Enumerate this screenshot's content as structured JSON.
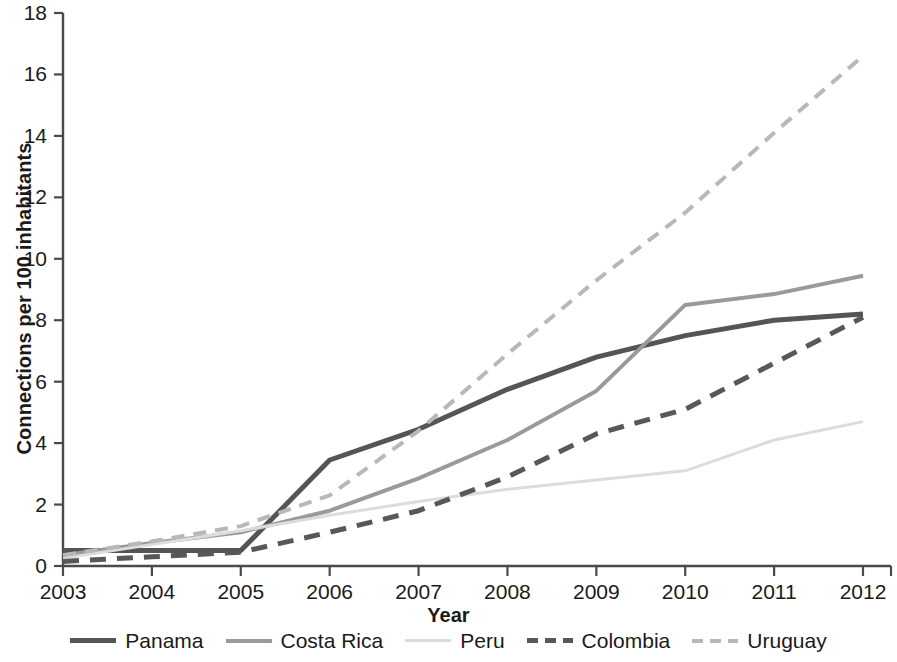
{
  "chart_data": {
    "type": "line",
    "title": "",
    "xlabel": "Year",
    "ylabel": "Connections per 100 inhabitants",
    "x": [
      2003,
      2004,
      2005,
      2006,
      2007,
      2008,
      2009,
      2010,
      2011,
      2012
    ],
    "xtick_labels": [
      "2003",
      "2004",
      "2005",
      "2006",
      "2007",
      "2008",
      "2009",
      "2010",
      "2011",
      "2012"
    ],
    "ytick_labels": [
      "0",
      "2",
      "4",
      "6",
      "8",
      "10",
      "12",
      "14",
      "16",
      "18"
    ],
    "ytick_values": [
      0,
      2,
      4,
      6,
      8,
      10,
      12,
      14,
      16,
      18
    ],
    "xlim": [
      2003,
      2012
    ],
    "ylim": [
      0,
      18
    ],
    "grid": false,
    "legend_position": "bottom",
    "series": [
      {
        "name": "Panama",
        "color": "#555555",
        "style": "solid",
        "width": 5,
        "values": [
          0.5,
          0.5,
          0.5,
          3.45,
          4.45,
          5.75,
          6.8,
          7.5,
          8.0,
          8.2
        ]
      },
      {
        "name": "Costa Rica",
        "color": "#9a9a9a",
        "style": "solid",
        "width": 4,
        "values": [
          0.35,
          0.75,
          1.1,
          1.8,
          2.85,
          4.1,
          5.7,
          8.5,
          8.85,
          9.45
        ]
      },
      {
        "name": "Peru",
        "color": "#dcdcdc",
        "style": "solid",
        "width": 3,
        "values": [
          0.25,
          0.7,
          1.15,
          1.65,
          2.1,
          2.5,
          2.8,
          3.1,
          4.1,
          4.7
        ]
      },
      {
        "name": "Colombia",
        "color": "#585858",
        "style": "dashed",
        "width": 5,
        "values": [
          0.15,
          0.3,
          0.45,
          1.1,
          1.8,
          2.9,
          4.3,
          5.1,
          6.6,
          8.1
        ]
      },
      {
        "name": "Uruguay",
        "color": "#b8b8b8",
        "style": "dashed",
        "width": 4,
        "values": [
          0.35,
          0.8,
          1.3,
          2.3,
          4.4,
          6.9,
          9.3,
          11.5,
          14.1,
          16.6
        ]
      }
    ]
  },
  "axis": {
    "color": "#4a4a4a"
  }
}
